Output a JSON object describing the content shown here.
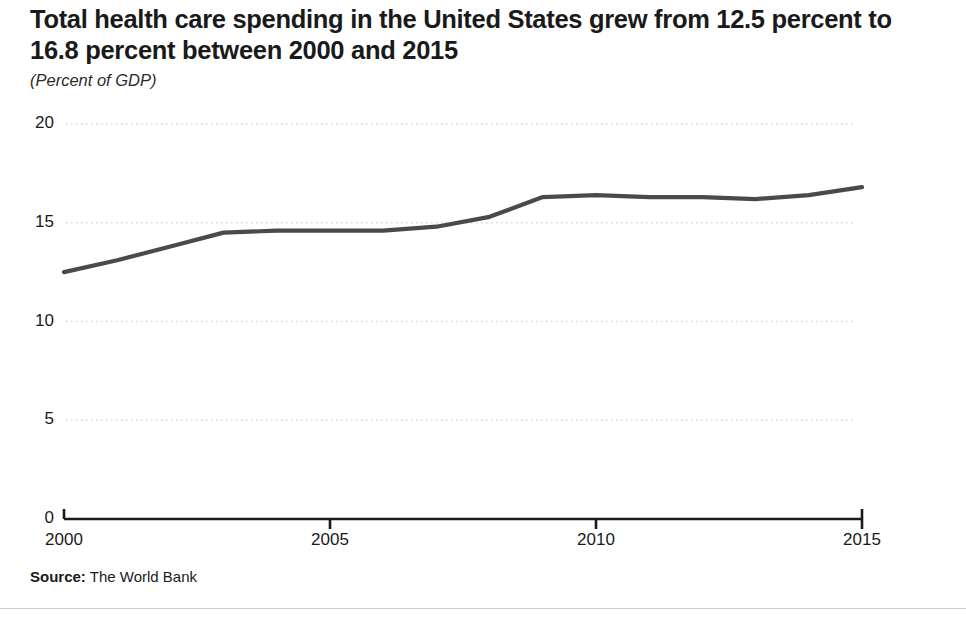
{
  "title": "Total health care spending in the United States grew from 12.5 percent to 16.8 percent between 2000 and 2015",
  "subtitle": "(Percent of GDP)",
  "source_label": "Source:",
  "source_value": "The World Bank",
  "colors": {
    "line": "#4a4a4a",
    "axis": "#1a1a1a",
    "grid": "#d8d8d8",
    "text": "#1a1a1a",
    "rule": "#c9ccce"
  },
  "chart_data": {
    "type": "line",
    "title": "Total health care spending in the United States grew from 12.5 percent to 16.8 percent between 2000 and 2015",
    "subtitle": "(Percent of GDP)",
    "xlabel": "",
    "ylabel": "Percent of GDP",
    "x": [
      2000,
      2001,
      2002,
      2003,
      2004,
      2005,
      2006,
      2007,
      2008,
      2009,
      2010,
      2011,
      2012,
      2013,
      2014,
      2015
    ],
    "series": [
      {
        "name": "Total health care spending",
        "values": [
          12.5,
          13.1,
          13.8,
          14.5,
          14.6,
          14.6,
          14.6,
          14.8,
          15.3,
          16.3,
          16.4,
          16.3,
          16.3,
          16.2,
          16.4,
          16.8
        ]
      }
    ],
    "xlim": [
      2000,
      2015
    ],
    "ylim": [
      0,
      20
    ],
    "xticks": [
      2000,
      2005,
      2010,
      2015
    ],
    "xtick_labels": [
      "2000",
      "2005",
      "2010",
      "2015"
    ],
    "yticks": [
      0,
      5,
      10,
      15,
      20
    ],
    "ytick_labels": [
      "0",
      "5",
      "10",
      "15",
      "20"
    ],
    "grid": "horizontal-dotted",
    "legend": "none",
    "annotations": []
  }
}
